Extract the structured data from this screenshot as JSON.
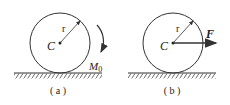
{
  "figures": [
    {
      "id": "a",
      "caption": "( a )",
      "center_label": "C",
      "radius_label": "r",
      "load_label": "M",
      "load_subscript": "0",
      "load_type": "couple-moment-clockwise"
    },
    {
      "id": "b",
      "caption": "( b )",
      "center_label": "C",
      "radius_label": "r",
      "load_label": "F",
      "load_type": "horizontal-force-right"
    }
  ],
  "colors": {
    "line": "#333333",
    "background": "#ffffff"
  }
}
